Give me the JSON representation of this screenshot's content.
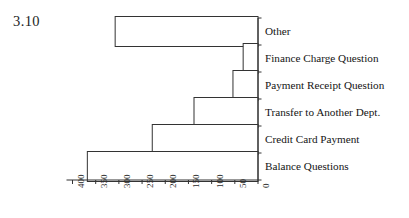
{
  "figure": {
    "number": "3.10"
  },
  "chart_data": {
    "type": "bar",
    "orientation": "horizontal",
    "title": "",
    "subtitle": "",
    "xlabel": "",
    "ylabel": "",
    "categories": [
      "Other",
      "Finance Charge Question",
      "Payment Receipt Question",
      "Transfer to Another Dept.",
      "Credit Card Payment",
      "Balance Questions"
    ],
    "values": [
      308,
      32,
      54,
      138,
      228,
      368
    ],
    "xlim": [
      400,
      0
    ],
    "xticks": [
      400,
      350,
      300,
      250,
      200,
      150,
      100,
      50,
      0
    ],
    "xticklabels": [
      "400",
      "350",
      "300",
      "250",
      "200",
      "150",
      "100",
      "50",
      "0"
    ],
    "axis_reversed": true,
    "grid": false,
    "legend": null,
    "bar_facecolor": "#ffffff",
    "bar_edgecolor": "#333333",
    "axis_color": "#333333",
    "tick_label_rotation": -90
  }
}
